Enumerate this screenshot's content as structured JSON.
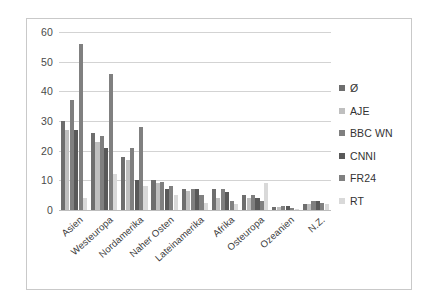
{
  "chart_data": {
    "type": "bar",
    "title": "",
    "subtitle": "",
    "xlabel": "",
    "ylabel": "",
    "ylim": [
      0,
      60
    ],
    "yticks": [
      0,
      10,
      20,
      30,
      40,
      50,
      60
    ],
    "grid": true,
    "legend_position": "right",
    "orientation": "vertical",
    "grouping": "clustered",
    "categories": [
      "Asien",
      "Westeuropa",
      "Nordamerika",
      "Naher Osten",
      "Lateinamerika",
      "Afrika",
      "Osteuropa",
      "Ozeanien",
      "N.Z."
    ],
    "series": [
      {
        "name": "Ø",
        "color": "#6e6e6e",
        "values": [
          30,
          26,
          18,
          10,
          7,
          7,
          5,
          1,
          2
        ]
      },
      {
        "name": "AJE",
        "color": "#bfbfbf",
        "values": [
          27,
          23,
          17,
          9,
          6.5,
          4,
          4,
          1,
          2
        ]
      },
      {
        "name": "BBC WN",
        "color": "#7f7f7f",
        "values": [
          37,
          25,
          21,
          9.5,
          7,
          7,
          5,
          1.5,
          3
        ]
      },
      {
        "name": "CNNI",
        "color": "#595959",
        "values": [
          27,
          21,
          10,
          7,
          7,
          6,
          4,
          1.5,
          3
        ]
      },
      {
        "name": "FR24",
        "color": "#808080",
        "values": [
          56,
          46,
          28,
          8,
          5,
          3,
          3,
          0.8,
          2.5
        ]
      },
      {
        "name": "RT",
        "color": "#d9d9d9",
        "values": [
          4,
          12,
          8,
          5,
          2.5,
          2,
          9,
          0.5,
          2
        ]
      }
    ]
  },
  "legend": {
    "items": [
      {
        "label": "Ø",
        "color": "#6e6e6e"
      },
      {
        "label": "AJE",
        "color": "#bfbfbf"
      },
      {
        "label": "BBC WN",
        "color": "#7f7f7f"
      },
      {
        "label": "CNNI",
        "color": "#595959"
      },
      {
        "label": "FR24",
        "color": "#808080"
      },
      {
        "label": "RT",
        "color": "#d9d9d9"
      }
    ]
  },
  "style": {
    "plot_background": "#ffffff",
    "frame_border": "#c9c9c9",
    "gridline_color": "#d3d3d3",
    "tick_text_color": "#4a4a4a"
  }
}
